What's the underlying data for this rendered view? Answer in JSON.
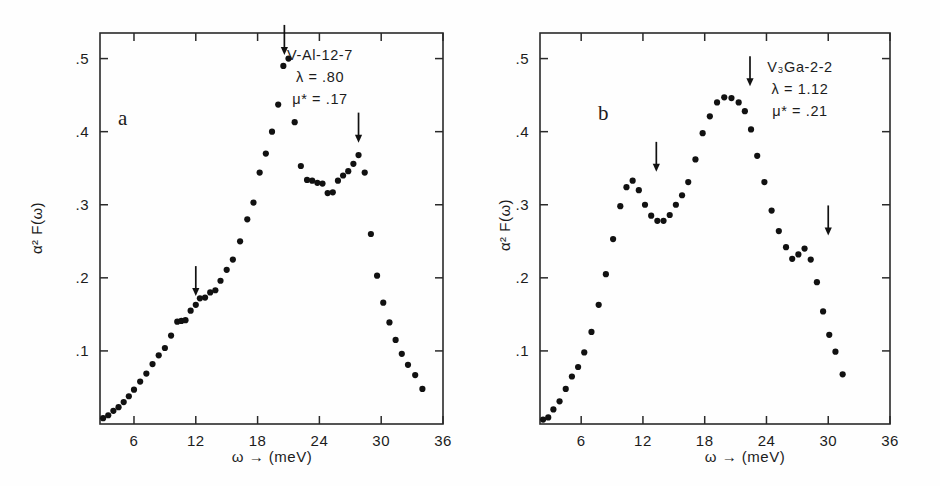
{
  "figure": {
    "background_color": "#fefefe",
    "ink_color": "#111111",
    "panels": [
      "a",
      "b"
    ]
  },
  "panel_a": {
    "letter": "a",
    "annotation": {
      "sample": "V-Al-12-7",
      "lambda": "λ = .80",
      "mustar": "μ* = .17"
    },
    "axes": {
      "xlabel": "ω → (meV)",
      "ylabel": "α² F(ω)",
      "xticks": [
        "6",
        "12",
        "18",
        "24",
        "30",
        "36"
      ],
      "yticks": [
        ".1",
        ".2",
        ".3",
        ".4",
        ".5"
      ]
    }
  },
  "panel_b": {
    "letter": "b",
    "annotation": {
      "sample": "V₃Ga-2-2",
      "lambda": "λ = 1.12",
      "mustar": "μ* = .21"
    },
    "axes": {
      "xlabel": "ω → (meV)",
      "ylabel": "α² F(ω)",
      "xticks": [
        "6",
        "12",
        "18",
        "24",
        "30",
        "36"
      ],
      "yticks": [
        ".1",
        ".2",
        ".3",
        ".4",
        ".5"
      ]
    }
  },
  "chart_data": [
    {
      "id": "panel-a",
      "type": "scatter",
      "title": "V-Al-12-7",
      "subtitle": "λ = .80, μ* = .17",
      "xlabel": "ω → (meV)",
      "ylabel": "α² F(ω)",
      "xlim": [
        2.7,
        36.0
      ],
      "ylim": [
        0.0,
        0.535
      ],
      "xticks": [
        6,
        12,
        18,
        24,
        30,
        36
      ],
      "yticks": [
        0.1,
        0.2,
        0.3,
        0.4,
        0.5
      ],
      "grid": false,
      "legend": null,
      "marker": "filled-circle",
      "x": [
        3.0,
        3.5,
        4.0,
        4.5,
        5.0,
        5.5,
        6.0,
        6.6,
        7.2,
        7.8,
        8.4,
        9.0,
        9.6,
        10.2,
        10.6,
        11.0,
        11.5,
        12.0,
        12.4,
        12.9,
        13.4,
        13.9,
        14.4,
        15.0,
        15.6,
        16.3,
        17.0,
        17.6,
        18.2,
        18.8,
        19.4,
        20.0,
        20.5,
        21.0,
        21.6,
        22.2,
        22.8,
        23.3,
        23.8,
        24.3,
        24.8,
        25.3,
        25.8,
        26.3,
        26.8,
        27.3,
        27.8,
        28.4,
        29.0,
        29.6,
        30.2,
        30.8,
        31.4,
        32.0,
        32.6,
        33.3,
        34.0
      ],
      "y": [
        0.008,
        0.012,
        0.018,
        0.023,
        0.03,
        0.038,
        0.047,
        0.058,
        0.069,
        0.082,
        0.094,
        0.104,
        0.121,
        0.14,
        0.141,
        0.142,
        0.155,
        0.163,
        0.172,
        0.173,
        0.18,
        0.183,
        0.196,
        0.211,
        0.225,
        0.25,
        0.28,
        0.303,
        0.344,
        0.37,
        0.4,
        0.437,
        0.49,
        0.5,
        0.413,
        0.353,
        0.334,
        0.333,
        0.33,
        0.329,
        0.316,
        0.317,
        0.333,
        0.34,
        0.346,
        0.356,
        0.368,
        0.344,
        0.26,
        0.203,
        0.166,
        0.139,
        0.115,
        0.096,
        0.081,
        0.067,
        0.048
      ],
      "annotations": [
        {
          "type": "arrow",
          "x": 12.0,
          "y_tip": 0.175,
          "direction": "down"
        },
        {
          "type": "arrow",
          "x": 20.6,
          "y_tip": 0.505,
          "direction": "down"
        },
        {
          "type": "arrow",
          "x": 27.8,
          "y_tip": 0.385,
          "direction": "down"
        }
      ]
    },
    {
      "id": "panel-b",
      "type": "scatter",
      "title": "V₃Ga-2-2",
      "subtitle": "λ = 1.12, μ* = .21",
      "xlabel": "ω → (meV)",
      "ylabel": "α² F(ω)",
      "xlim": [
        2.0,
        36.0
      ],
      "ylim": [
        0.0,
        0.535
      ],
      "xticks": [
        6,
        12,
        18,
        24,
        30,
        36
      ],
      "yticks": [
        0.1,
        0.2,
        0.3,
        0.4,
        0.5
      ],
      "grid": false,
      "legend": null,
      "marker": "filled-circle",
      "x": [
        2.3,
        2.8,
        3.3,
        3.9,
        4.5,
        5.1,
        5.7,
        6.3,
        7.0,
        7.7,
        8.4,
        9.1,
        9.8,
        10.4,
        11.0,
        11.6,
        12.2,
        12.8,
        13.4,
        14.0,
        14.6,
        15.2,
        15.8,
        16.4,
        17.1,
        17.8,
        18.5,
        19.2,
        19.9,
        20.6,
        21.3,
        21.9,
        22.5,
        23.1,
        23.8,
        24.5,
        25.2,
        25.9,
        26.5,
        27.1,
        27.7,
        28.3,
        28.9,
        29.5,
        30.1,
        30.7,
        31.4,
        32.1,
        32.8,
        33.5,
        34.3,
        35.1
      ],
      "y": [
        0.006,
        0.009,
        0.02,
        0.031,
        0.048,
        0.065,
        0.078,
        0.098,
        0.126,
        0.163,
        0.205,
        0.253,
        0.298,
        0.324,
        0.333,
        0.32,
        0.3,
        0.285,
        0.278,
        0.278,
        0.286,
        0.3,
        0.313,
        0.331,
        0.362,
        0.398,
        0.421,
        0.44,
        0.447,
        0.446,
        0.44,
        0.428,
        0.403,
        0.367,
        0.331,
        0.292,
        0.264,
        0.242,
        0.226,
        0.232,
        0.24,
        0.225,
        0.194,
        0.154,
        0.122,
        0.099,
        0.068,
        0.0,
        0.0,
        0.0,
        0.0,
        0.0
      ],
      "annotations": [
        {
          "type": "arrow",
          "x": 13.3,
          "y_tip": 0.345,
          "direction": "down"
        },
        {
          "type": "arrow",
          "x": 22.4,
          "y_tip": 0.462,
          "direction": "down"
        },
        {
          "type": "arrow",
          "x": 30.0,
          "y_tip": 0.258,
          "direction": "down"
        }
      ]
    }
  ]
}
